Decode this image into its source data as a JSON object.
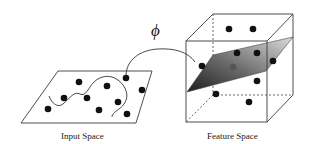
{
  "diagram": {
    "mapping_label": "ϕ",
    "input_space": {
      "caption": "Input Space",
      "plane": [
        [
          58,
          71
        ],
        [
          152,
          71
        ],
        [
          136,
          123
        ],
        [
          21,
          123
        ]
      ],
      "points": [
        [
          78,
          81
        ],
        [
          126,
          78
        ],
        [
          61,
          98
        ],
        [
          87,
          97
        ],
        [
          107,
          85
        ],
        [
          118,
          101
        ],
        [
          98,
          108
        ],
        [
          48,
          109
        ],
        [
          142,
          89
        ],
        [
          127,
          114
        ]
      ],
      "boundary_curve": "M 49 96 C 52 104, 58 108, 63 104 C 70 98, 74 91, 80 94 C 86 97, 88 88, 94 82 C 100 76, 110 74, 118 80 C 126 86, 130 96, 124 104 C 120 110, 112 112, 112 117"
    },
    "feature_space": {
      "caption": "Feature Space",
      "cube": {
        "front": [
          186,
          41,
          267,
          122
        ],
        "back": [
          213,
          14,
          293,
          95
        ]
      },
      "plane": [
        [
          187,
          92
        ],
        [
          213,
          55
        ],
        [
          293,
          37
        ],
        [
          266,
          71
        ]
      ],
      "points": [
        [
          229,
          29
        ],
        [
          253,
          29
        ],
        [
          237,
          53
        ],
        [
          257,
          53
        ],
        [
          232,
          66
        ],
        [
          205,
          65
        ],
        [
          303,
          61
        ],
        [
          257,
          81
        ],
        [
          216,
          93
        ],
        [
          249,
          102
        ]
      ],
      "hidden_points": [
        [
          233,
          66
        ]
      ]
    },
    "colors": {
      "line": "#3a3a3a",
      "point": "#111111",
      "plane_dark": "#2a2a2a",
      "plane_light": "#d8d8d8"
    }
  }
}
